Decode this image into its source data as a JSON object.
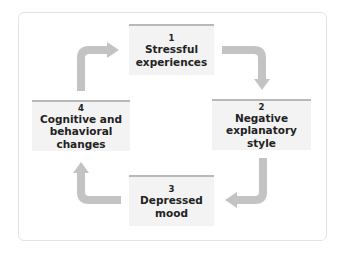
{
  "diagram": {
    "title": "",
    "colors": {
      "box_fill": "#f3f3f3",
      "box_top_rule": "#b9b9b9",
      "arrow": "#c3c3c3",
      "text": "#222222"
    },
    "boxes": [
      {
        "number": "1",
        "label": "Stressful\nexperiences"
      },
      {
        "number": "2",
        "label": "Negative\nexplanatory style"
      },
      {
        "number": "3",
        "label": "Depressed\nmood"
      },
      {
        "number": "4",
        "label": "Cognitive and\nbehavioral changes"
      }
    ],
    "arrows": [
      {
        "from": "1",
        "to": "2"
      },
      {
        "from": "2",
        "to": "3"
      },
      {
        "from": "3",
        "to": "4"
      },
      {
        "from": "4",
        "to": "1"
      }
    ]
  }
}
